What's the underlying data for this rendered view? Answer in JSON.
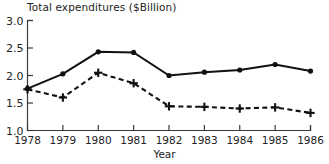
{
  "chart_data": {
    "type": "line",
    "title": "Total expenditures ($Billion)",
    "xlabel": "Year",
    "ylabel": "",
    "categories": [
      1978,
      1979,
      1980,
      1981,
      1982,
      1983,
      1984,
      1985,
      1986
    ],
    "x": [
      1978,
      1979,
      1980,
      1981,
      1982,
      1983,
      1984,
      1985,
      1986
    ],
    "xtick_labels": [
      "1978",
      "1979",
      "1980",
      "1981",
      "1982",
      "1983",
      "1984",
      "1985",
      "1986"
    ],
    "ytick_labels": [
      "1.0",
      "1.5",
      "2.0",
      "2.5",
      "3.0"
    ],
    "yticks": [
      1.0,
      1.5,
      2.0,
      2.5,
      3.0
    ],
    "ylim": [
      1.0,
      3.0
    ],
    "xlim": [
      1978,
      1986
    ],
    "grid": false,
    "legend": "none",
    "series": [
      {
        "name": "solid-series",
        "style": "solid",
        "marker": "circle",
        "color": "#111111",
        "values": [
          1.76,
          2.03,
          2.43,
          2.42,
          2.0,
          2.06,
          2.1,
          2.2,
          2.08
        ]
      },
      {
        "name": "dashed-series",
        "style": "dashed",
        "marker": "plus",
        "color": "#111111",
        "values": [
          1.75,
          1.6,
          2.05,
          1.86,
          1.44,
          1.43,
          1.4,
          1.42,
          1.32
        ]
      }
    ]
  }
}
